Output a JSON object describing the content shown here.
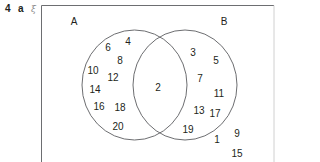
{
  "question": {
    "number": "4",
    "part": "a",
    "universal_symbol": "ξ"
  },
  "diagram": {
    "type": "venn",
    "stroke_color": "#6d6e71",
    "text_color": "#231f20",
    "sets": [
      {
        "name": "A",
        "label_pos": [
          74,
          22
        ]
      },
      {
        "name": "B",
        "label_pos": [
          224,
          22
        ]
      }
    ],
    "regions": {
      "A_only": [
        {
          "value": "4",
          "pos": [
            128,
            42
          ]
        },
        {
          "value": "6",
          "pos": [
            108,
            48
          ]
        },
        {
          "value": "8",
          "pos": [
            120,
            61
          ]
        },
        {
          "value": "10",
          "pos": [
            93,
            71
          ]
        },
        {
          "value": "12",
          "pos": [
            113,
            78
          ]
        },
        {
          "value": "14",
          "pos": [
            95,
            90
          ]
        },
        {
          "value": "16",
          "pos": [
            99,
            107
          ]
        },
        {
          "value": "18",
          "pos": [
            120,
            108
          ]
        },
        {
          "value": "20",
          "pos": [
            118,
            127
          ]
        }
      ],
      "A_and_B": [
        {
          "value": "2",
          "pos": [
            158,
            88
          ]
        }
      ],
      "B_only": [
        {
          "value": "3",
          "pos": [
            193,
            53
          ]
        },
        {
          "value": "5",
          "pos": [
            216,
            61
          ]
        },
        {
          "value": "7",
          "pos": [
            200,
            79
          ]
        },
        {
          "value": "11",
          "pos": [
            219,
            94
          ]
        },
        {
          "value": "13",
          "pos": [
            199,
            111
          ]
        },
        {
          "value": "17",
          "pos": [
            215,
            114
          ]
        },
        {
          "value": "19",
          "pos": [
            188,
            130
          ]
        }
      ],
      "outside": [
        {
          "value": "9",
          "pos": [
            237,
            134
          ]
        },
        {
          "value": "1",
          "pos": [
            217,
            140
          ]
        },
        {
          "value": "15",
          "pos": [
            237,
            154
          ]
        }
      ]
    }
  }
}
